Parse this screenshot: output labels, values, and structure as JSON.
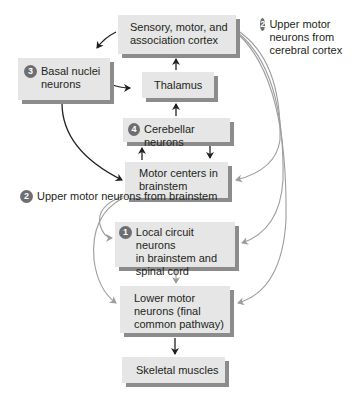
{
  "diagram": {
    "type": "flowchart",
    "colors": {
      "box_fill": "#e6e6e6",
      "box_shadow": "#8c8c8c",
      "badge": "#6d6e71",
      "black_arrow": "#231f20",
      "gray_arrow": "#9d9d9d"
    },
    "nodes": {
      "cortex": {
        "lines": [
          "Sensory, motor, and",
          "association cortex"
        ]
      },
      "basal": {
        "badge": "3",
        "lines": [
          "Basal nuclei",
          "neurons"
        ]
      },
      "thalamus": {
        "lines": [
          "Thalamus"
        ]
      },
      "cerebellar": {
        "badge": "4",
        "lines": [
          "Cerebellar neurons"
        ]
      },
      "motor_centers": {
        "lines": [
          "Motor centers in",
          "brainstem"
        ]
      },
      "local_circuit": {
        "badge": "1",
        "lines": [
          "Local circuit neurons",
          "in brainstem and",
          "spinal cord"
        ]
      },
      "lower_motor": {
        "lines": [
          "Lower motor",
          "neurons (final",
          "common pathway)"
        ]
      },
      "skeletal": {
        "lines": [
          "Skeletal muscles"
        ]
      }
    },
    "labels": {
      "umn_cortex": {
        "badge": "2",
        "lines": [
          "Upper motor",
          "neurons",
          "from cerebral",
          "cortex"
        ]
      },
      "umn_brainstem": {
        "badge": "2",
        "lines": [
          "Upper motor",
          "neurons from",
          "brainstem"
        ]
      }
    },
    "edges": [
      {
        "from": "cortex",
        "to": "basal",
        "style": "black"
      },
      {
        "from": "basal",
        "to": "thalamus",
        "style": "black"
      },
      {
        "from": "thalamus",
        "to": "cortex",
        "style": "black"
      },
      {
        "from": "cerebellar",
        "to": "thalamus",
        "style": "black"
      },
      {
        "from": "motor_centers",
        "to": "cerebellar",
        "style": "black"
      },
      {
        "from": "cerebellar",
        "to": "motor_centers",
        "style": "black"
      },
      {
        "from": "basal",
        "to": "motor_centers",
        "style": "black"
      },
      {
        "from": "cortex",
        "to": "motor_centers",
        "style": "gray"
      },
      {
        "from": "cortex",
        "to": "local_circuit",
        "style": "gray"
      },
      {
        "from": "cortex",
        "to": "lower_motor",
        "style": "gray"
      },
      {
        "from": "motor_centers",
        "to": "local_circuit",
        "style": "gray"
      },
      {
        "from": "motor_centers",
        "to": "lower_motor",
        "style": "gray"
      },
      {
        "from": "local_circuit",
        "to": "lower_motor",
        "style": "gray"
      },
      {
        "from": "lower_motor",
        "to": "skeletal",
        "style": "black"
      }
    ]
  }
}
